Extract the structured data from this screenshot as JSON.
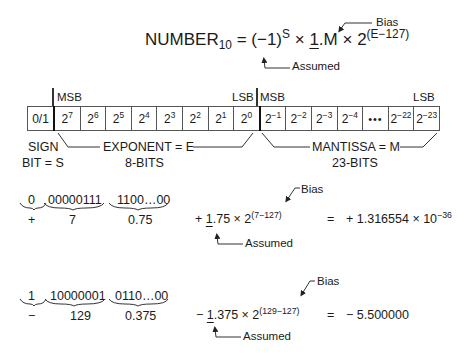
{
  "formula": {
    "lhs": "NUMBER",
    "lhs_sub": "10",
    "eq": "=",
    "sign_base": "(−1)",
    "sign_exp": "S",
    "times1": "×",
    "assumed_one": "1",
    "mantissa": ".M",
    "times2": "×",
    "base": "2",
    "exponent": "(E−127)",
    "bias_label": "Bias",
    "assumed_label": "Assumed"
  },
  "bit_layout": {
    "labels": {
      "msb_left": "MSB",
      "lsb_mid": "LSB",
      "msb_mid": "MSB",
      "lsb_right": "LSB"
    },
    "sign_cell": "0/1",
    "exponent_cells": [
      {
        "base": "2",
        "exp": "7"
      },
      {
        "base": "2",
        "exp": "6"
      },
      {
        "base": "2",
        "exp": "5"
      },
      {
        "base": "2",
        "exp": "4"
      },
      {
        "base": "2",
        "exp": "3"
      },
      {
        "base": "2",
        "exp": "2"
      },
      {
        "base": "2",
        "exp": "1"
      },
      {
        "base": "2",
        "exp": "0"
      }
    ],
    "mantissa_cells": [
      {
        "base": "2",
        "exp": "−1"
      },
      {
        "base": "2",
        "exp": "−2"
      },
      {
        "base": "2",
        "exp": "−3"
      },
      {
        "base": "2",
        "exp": "−4"
      },
      {
        "base": "",
        "exp": "",
        "dots": "•••"
      },
      {
        "base": "2",
        "exp": "−22"
      },
      {
        "base": "2",
        "exp": "−23"
      }
    ],
    "sign_label_1": "SIGN",
    "sign_label_2": "BIT = S",
    "exponent_label": "EXPONENT = E",
    "exponent_bits": "8-BITS",
    "mantissa_label": "MANTISSA = M",
    "mantissa_bits": "23-BITS"
  },
  "examples": [
    {
      "sign_bits": "0",
      "exp_bits": "00000111",
      "man_bits": "1100…00",
      "sign_val": "+",
      "exp_val": "7",
      "man_val": "0.75",
      "expr_sign": "+",
      "expr_one": "1",
      "expr_frac": ".75 × 2",
      "expr_exp": "(7−127)",
      "eq": "=",
      "result": "+ 1.316554 × 10",
      "result_exp": "−36",
      "bias_label": "Bias",
      "assumed_label": "Assumed"
    },
    {
      "sign_bits": "1",
      "exp_bits": "10000001",
      "man_bits": "0110…00",
      "sign_val": "−",
      "exp_val": "129",
      "man_val": "0.375",
      "expr_sign": "−",
      "expr_one": "1",
      "expr_frac": ".375 × 2",
      "expr_exp": "(129−127)",
      "eq": "=",
      "result": "−  5.500000",
      "result_exp": "",
      "bias_label": "Bias",
      "assumed_label": "Assumed"
    }
  ]
}
